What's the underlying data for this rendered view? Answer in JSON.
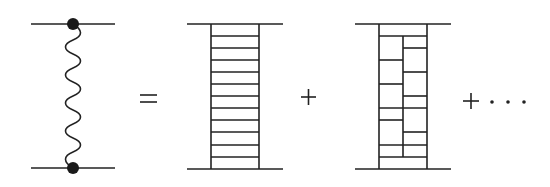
{
  "diagram": {
    "stroke_color": "#222222",
    "terms": [
      {
        "id": "lhs",
        "type": "wavy-exchange",
        "top_line": {
          "x1": 31,
          "x2": 115,
          "y": 24
        },
        "bottom_line": {
          "x1": 31,
          "x2": 115,
          "y": 168
        },
        "vertex_x": 73,
        "vertices": [
          "top-vertex",
          "bottom-vertex"
        ]
      },
      {
        "id": "ladder-simple",
        "type": "ladder",
        "top_line": {
          "x1": 187,
          "x2": 283,
          "y": 24
        },
        "bottom_line": {
          "x1": 187,
          "x2": 283,
          "y": 169
        },
        "rails_x": [
          211,
          259
        ],
        "rungs_y": [
          36,
          48,
          60,
          72,
          84,
          96,
          108,
          120,
          132,
          145,
          157
        ]
      },
      {
        "id": "ladder-crossed",
        "type": "split-ladder",
        "top_line": {
          "x1": 355,
          "x2": 451,
          "y": 24
        },
        "bottom_line": {
          "x1": 355,
          "x2": 451,
          "y": 169
        },
        "rails_x": [
          379,
          427
        ],
        "middle_rail": {
          "x": 403,
          "y1": 36,
          "y2": 157
        },
        "full_rungs_y": [
          36,
          108,
          145,
          157
        ],
        "left_rungs_y": [
          60,
          84,
          120
        ],
        "right_rungs_y": [
          48,
          72,
          96,
          132
        ]
      }
    ],
    "operators": {
      "equals": "=",
      "plus1": "+",
      "plus2": "+",
      "ellipsis": "· · ·"
    }
  }
}
